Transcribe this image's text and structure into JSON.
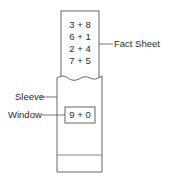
{
  "diagram": {
    "fact_sheet": {
      "label": "Fact Sheet",
      "facts": [
        "3 + 8",
        "6 + 1",
        "2 + 4",
        "7 + 5"
      ]
    },
    "sleeve": {
      "label": "Sleeve"
    },
    "window": {
      "label": "Window",
      "value": "9 + 0"
    },
    "stroke_color": "#555555"
  }
}
